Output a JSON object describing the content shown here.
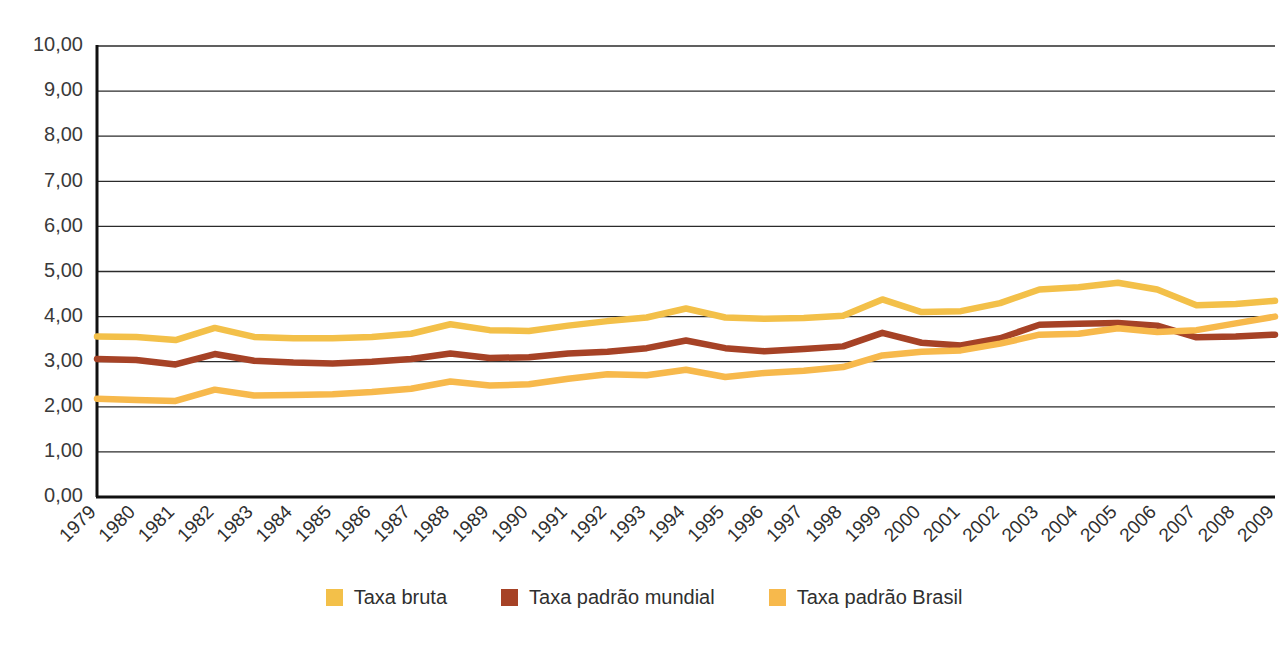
{
  "chart_data": {
    "type": "line",
    "title": "",
    "xlabel": "",
    "ylabel": "",
    "ylim": [
      0,
      10
    ],
    "ytick_step": 1,
    "grid": true,
    "legend_position": "bottom",
    "decimal_separator": ",",
    "ytick_labels": [
      "0,00",
      "1,00",
      "2,00",
      "3,00",
      "4,00",
      "5,00",
      "6,00",
      "7,00",
      "8,00",
      "9,00",
      "10,00"
    ],
    "categories": [
      "1979",
      "1980",
      "1981",
      "1982",
      "1983",
      "1984",
      "1985",
      "1986",
      "1987",
      "1988",
      "1989",
      "1990",
      "1991",
      "1992",
      "1993",
      "1994",
      "1995",
      "1996",
      "1997",
      "1998",
      "1999",
      "2000",
      "2001",
      "2002",
      "2003",
      "2004",
      "2005",
      "2006",
      "2007",
      "2008",
      "2009"
    ],
    "series": [
      {
        "name": "Taxa bruta",
        "color": "#F3C049",
        "values": [
          3.56,
          3.55,
          3.48,
          3.75,
          3.55,
          3.52,
          3.52,
          3.55,
          3.62,
          3.83,
          3.7,
          3.68,
          3.8,
          3.9,
          3.98,
          4.18,
          3.98,
          3.95,
          3.97,
          4.02,
          4.38,
          4.1,
          4.12,
          4.3,
          4.6,
          4.65,
          4.75,
          4.6,
          4.25,
          4.28,
          4.35
        ]
      },
      {
        "name": "Taxa padrão mundial",
        "color": "#A64226",
        "values": [
          3.06,
          3.04,
          2.94,
          3.17,
          3.02,
          2.98,
          2.96,
          3.0,
          3.06,
          3.18,
          3.08,
          3.1,
          3.18,
          3.22,
          3.3,
          3.47,
          3.3,
          3.23,
          3.28,
          3.34,
          3.64,
          3.42,
          3.36,
          3.52,
          3.82,
          3.84,
          3.86,
          3.8,
          3.54,
          3.56,
          3.6
        ]
      },
      {
        "name": "Taxa padrão Brasil",
        "color": "#F7B94C",
        "values": [
          2.18,
          2.15,
          2.13,
          2.38,
          2.25,
          2.26,
          2.28,
          2.33,
          2.4,
          2.56,
          2.47,
          2.5,
          2.62,
          2.72,
          2.7,
          2.82,
          2.66,
          2.75,
          2.8,
          2.88,
          3.14,
          3.22,
          3.25,
          3.4,
          3.6,
          3.62,
          3.74,
          3.66,
          3.7,
          3.85,
          4.0
        ]
      }
    ]
  },
  "legend": {
    "items": [
      {
        "label": "Taxa bruta",
        "color": "#F3C049"
      },
      {
        "label": "Taxa padrão mundial",
        "color": "#A64226"
      },
      {
        "label": "Taxa padrão Brasil",
        "color": "#F7B94C"
      }
    ]
  }
}
